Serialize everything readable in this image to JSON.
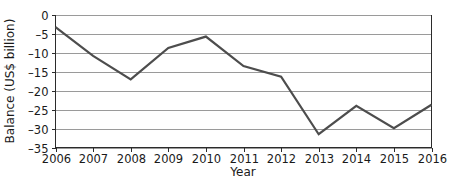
{
  "chart_data": {
    "type": "line",
    "title": "",
    "xlabel": "Year",
    "ylabel": "Balance (US$ billion)",
    "x": [
      2006,
      2007,
      2008,
      2009,
      2010,
      2011,
      2012,
      2013,
      2014,
      2015,
      2016
    ],
    "xticklabels": [
      "2006",
      "2007",
      "2008",
      "2009",
      "2010",
      "2011",
      "2012",
      "2013",
      "2014",
      "2015",
      "2016"
    ],
    "values": [
      -3.2,
      -10.8,
      -17.0,
      -8.7,
      -5.7,
      -13.5,
      -16.3,
      -31.5,
      -24.0,
      -29.9,
      -23.7
    ],
    "series": [
      {
        "name": "Balance",
        "values": [
          -3.2,
          -10.8,
          -17.0,
          -8.7,
          -5.7,
          -13.5,
          -16.3,
          -31.5,
          -24.0,
          -29.9,
          -23.7
        ]
      }
    ],
    "yticks": [
      0,
      -5,
      -10,
      -15,
      -20,
      -25,
      -30,
      -35
    ],
    "yticklabels": [
      "0",
      "–5",
      "–10",
      "–15",
      "–20",
      "–25",
      "–30",
      "–35"
    ],
    "ylim": [
      -35,
      0
    ],
    "xlim": [
      2006,
      2016
    ],
    "grid": true,
    "grid_axis": "y",
    "legend": false,
    "legend_position": "none",
    "line_color": "#4d4d4d",
    "grid_color": "#9a9a9a",
    "frame_color": "#2b2b2b",
    "background_color": "#ffffff"
  }
}
